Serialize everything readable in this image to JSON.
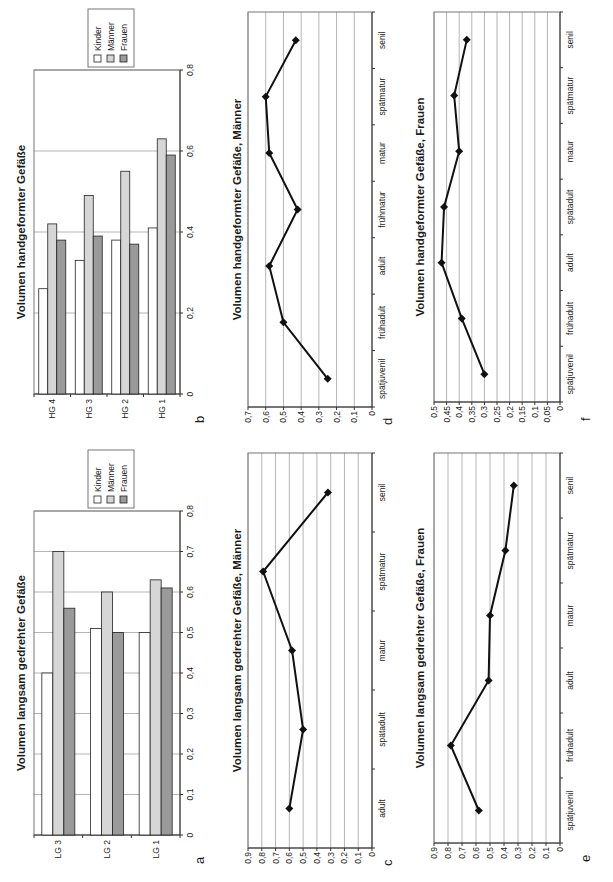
{
  "page": {
    "width": 613,
    "height": 882,
    "background": "#ffffff",
    "rotation_note": "all charts rotated 90deg counterclockwise on page"
  },
  "colors": {
    "series_kinder": "#ffffff",
    "series_maenner": "#d6d6d6",
    "series_frauen": "#9a9a9a",
    "line_series": "#111111",
    "gridline": "#b5b5b5",
    "plot_border": "#777777",
    "axis": "#333333",
    "text": "#1c1c1c"
  },
  "chart_data": [
    {
      "id": "a",
      "panel_letter": "a",
      "type": "bar",
      "bar_direction": "horizontal",
      "title": "Volumen langsam gedrehter Gefäße",
      "categories": [
        "LG 3",
        "LG 2",
        "LG 1"
      ],
      "series": [
        {
          "name": "Kinder",
          "color": "#ffffff",
          "values": [
            0.4,
            0.51,
            0.5
          ]
        },
        {
          "name": "Männer",
          "color": "#d6d6d6",
          "values": [
            0.7,
            0.6,
            0.63
          ]
        },
        {
          "name": "Frauen",
          "color": "#9a9a9a",
          "values": [
            0.56,
            0.5,
            0.61
          ]
        }
      ],
      "value_axis": {
        "min": 0,
        "max": 0.8,
        "step": 0.1,
        "tick_labels": [
          "0",
          "0,1",
          "0,2",
          "0,3",
          "0,4",
          "0,5",
          "0,6",
          "0,7",
          "0,8"
        ]
      },
      "legend": {
        "position": "right",
        "entries": [
          "Kinder",
          "Männer",
          "Frauen"
        ]
      },
      "grid": true
    },
    {
      "id": "b",
      "panel_letter": "b",
      "type": "bar",
      "bar_direction": "horizontal",
      "title": "Volumen handgeformter Gefäße",
      "categories": [
        "HG 4",
        "HG 3",
        "HG 2",
        "HG 1"
      ],
      "series": [
        {
          "name": "Kinder",
          "color": "#ffffff",
          "values": [
            0.26,
            0.33,
            0.38,
            0.41
          ]
        },
        {
          "name": "Männer",
          "color": "#d6d6d6",
          "values": [
            0.42,
            0.49,
            0.55,
            0.63
          ]
        },
        {
          "name": "Frauen",
          "color": "#9a9a9a",
          "values": [
            0.38,
            0.39,
            0.37,
            0.59
          ]
        }
      ],
      "value_axis": {
        "min": 0,
        "max": 0.8,
        "step": 0.2,
        "tick_labels": [
          "0",
          "0,2",
          "0,4",
          "0,6",
          "0,8"
        ]
      },
      "legend": {
        "position": "right",
        "entries": [
          "Kinder",
          "Männer",
          "Frauen"
        ]
      },
      "grid": true
    },
    {
      "id": "c",
      "panel_letter": "c",
      "type": "line",
      "marker": "diamond",
      "title": "Volumen langsam gedrehter Gefäße, Männer",
      "categories": [
        "adult",
        "spätadult",
        "matur",
        "spätmatur",
        "senil"
      ],
      "series": [
        {
          "name": "Männer",
          "color": "#111111",
          "values": [
            0.6,
            0.5,
            0.58,
            0.79,
            0.32
          ]
        }
      ],
      "value_axis": {
        "min": 0,
        "max": 0.9,
        "step": 0.1,
        "tick_labels": [
          "0",
          "0,1",
          "0,2",
          "0,3",
          "0,4",
          "0,5",
          "0,6",
          "0,7",
          "0,8",
          "0,9"
        ]
      },
      "legend": null,
      "grid": true
    },
    {
      "id": "d",
      "panel_letter": "d",
      "type": "line",
      "marker": "diamond",
      "title": "Volumen handgeformter Gefäße, Männer",
      "categories": [
        "spätjuvenil",
        "frühadult",
        "adult",
        "frühmatur",
        "matur",
        "spätmatur",
        "senil"
      ],
      "series": [
        {
          "name": "Männer",
          "color": "#111111",
          "values": [
            0.25,
            0.5,
            0.58,
            0.42,
            0.58,
            0.6,
            0.43
          ]
        }
      ],
      "value_axis": {
        "min": 0,
        "max": 0.7,
        "step": 0.1,
        "tick_labels": [
          "0",
          "0,1",
          "0,2",
          "0,3",
          "0,4",
          "0,5",
          "0,6",
          "0,7"
        ]
      },
      "legend": null,
      "grid": true
    },
    {
      "id": "e",
      "panel_letter": "e",
      "type": "line",
      "marker": "diamond",
      "title": "Volumen langsam gedrehter Gefäße, Frauen",
      "categories": [
        "spätjuvenil",
        "frühadult",
        "adult",
        "matur",
        "spätmatur",
        "senil"
      ],
      "series": [
        {
          "name": "Frauen",
          "color": "#111111",
          "values": [
            0.58,
            0.78,
            0.51,
            0.5,
            0.39,
            0.33
          ]
        }
      ],
      "value_axis": {
        "min": 0,
        "max": 0.9,
        "step": 0.1,
        "tick_labels": [
          "0",
          "0,1",
          "0,2",
          "0,3",
          "0,4",
          "0,5",
          "0,6",
          "0,7",
          "0,8",
          "0,9"
        ]
      },
      "legend": null,
      "grid": true
    },
    {
      "id": "f",
      "panel_letter": "f",
      "type": "line",
      "marker": "diamond",
      "title": "Volumen handgeformter Gefäße, Frauen",
      "categories": [
        "spätjuvenil",
        "frühadult",
        "adult",
        "spätadult",
        "matur",
        "spätmatur",
        "senil"
      ],
      "series": [
        {
          "name": "Frauen",
          "color": "#111111",
          "values": [
            0.3,
            0.39,
            0.47,
            0.46,
            0.4,
            0.42,
            0.37
          ]
        }
      ],
      "value_axis": {
        "min": 0,
        "max": 0.5,
        "step": 0.05,
        "tick_labels": [
          "0",
          "0,05",
          "0,1",
          "0,15",
          "0,2",
          "0,25",
          "0,3",
          "0,35",
          "0,4",
          "0,45",
          "0,5"
        ]
      },
      "legend": null,
      "grid": true
    }
  ]
}
